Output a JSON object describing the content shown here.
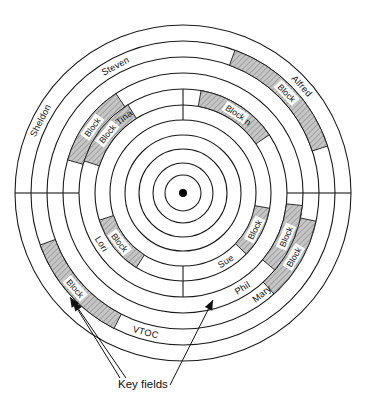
{
  "figure": {
    "type": "disk-track-diagram",
    "center": {
      "x": 183,
      "y": 193
    },
    "hub_dot_radius": 4,
    "ring_radii": [
      18,
      30,
      44,
      58,
      73,
      88,
      104,
      120,
      136,
      152,
      168
    ],
    "colors": {
      "line": "#1a1a1a",
      "block_fill": "#b9b9b9",
      "background": "#ffffff",
      "label_text": "#111111"
    }
  },
  "tracks": [
    {
      "id": "track-outer",
      "index": 1,
      "inner_radius": 152,
      "outer_radius": 168,
      "labels": [
        {
          "name": "Alfred",
          "angle": -42
        },
        {
          "name": "Sheldon",
          "angle": 207
        }
      ],
      "blocks": [],
      "sector_breaks": [
        0,
        180
      ]
    },
    {
      "id": "track-2",
      "index": 2,
      "inner_radius": 136,
      "outer_radius": 152,
      "labels": [
        {
          "name": "Steven",
          "angle": 242
        },
        {
          "name": "VTOC",
          "angle": 105
        }
      ],
      "blocks": [
        {
          "label": "Block",
          "start_angle": -70,
          "end_angle": -18
        },
        {
          "label": "Block",
          "start_angle": 117,
          "end_angle": 160
        }
      ],
      "sector_breaks": [
        0,
        180
      ]
    },
    {
      "id": "track-3",
      "index": 3,
      "inner_radius": 120,
      "outer_radius": 136,
      "labels": [
        {
          "name": "Mary",
          "angle": 52
        }
      ],
      "blocks": [
        {
          "label": "Block",
          "start_angle": 12,
          "end_angle": 48
        }
      ],
      "sector_breaks": [
        0,
        180
      ]
    },
    {
      "id": "track-4",
      "index": 4,
      "inner_radius": 104,
      "outer_radius": 120,
      "labels": [
        {
          "name": "Phil",
          "angle": 58
        }
      ],
      "blocks": [
        {
          "label": "Block",
          "start_angle": 6,
          "end_angle": 40
        },
        {
          "label": "Block",
          "start_angle": 196,
          "end_angle": 236
        }
      ],
      "sector_breaks": [
        0,
        180
      ]
    },
    {
      "id": "track-5",
      "index": 5,
      "inner_radius": 88,
      "outer_radius": 104,
      "labels": [
        {
          "name": "Tina",
          "angle": 232
        },
        {
          "name": "John",
          "angle": -52
        },
        {
          "name": "Lori",
          "angle": 148
        }
      ],
      "blocks": [
        {
          "label": "Block",
          "start_angle": -80,
          "end_angle": -34
        },
        {
          "label": "Block",
          "start_angle": 198,
          "end_angle": 238
        }
      ],
      "sector_breaks": [
        270,
        90
      ]
    },
    {
      "id": "track-6",
      "index": 6,
      "inner_radius": 73,
      "outer_radius": 88,
      "labels": [
        {
          "name": "Sue",
          "angle": 58
        }
      ],
      "blocks": [
        {
          "label": "Block",
          "start_angle": 10,
          "end_angle": 44
        },
        {
          "label": "Block",
          "start_angle": 122,
          "end_angle": 162
        }
      ],
      "sector_breaks": [
        90,
        270
      ]
    },
    {
      "id": "track-7",
      "index": 7,
      "inner_radius": 58,
      "outer_radius": 73,
      "labels": [],
      "blocks": [],
      "sector_breaks": []
    },
    {
      "id": "track-8",
      "index": 8,
      "inner_radius": 44,
      "outer_radius": 58,
      "labels": [],
      "blocks": [],
      "sector_breaks": []
    },
    {
      "id": "track-9",
      "index": 9,
      "inner_radius": 30,
      "outer_radius": 44,
      "labels": [],
      "blocks": [],
      "sector_breaks": []
    },
    {
      "id": "track-10",
      "index": 10,
      "inner_radius": 18,
      "outer_radius": 30,
      "labels": [],
      "blocks": [],
      "sector_breaks": []
    }
  ],
  "annotations": {
    "callout_label": "Key fields",
    "callout_text_x": 118,
    "callout_text_y": 388,
    "arrows": [
      {
        "id": "arrow-left",
        "from": {
          "x": 120,
          "y": 378
        },
        "to": {
          "x": 70,
          "y": 297
        },
        "target": "block-track-2-lower-left"
      },
      {
        "id": "arrow-left-2",
        "from": {
          "x": 126,
          "y": 378
        },
        "to": {
          "x": 73,
          "y": 301
        },
        "target": "block-track-2-lower-left-edge"
      },
      {
        "id": "arrow-right",
        "from": {
          "x": 170,
          "y": 385
        },
        "to": {
          "x": 213,
          "y": 300
        },
        "target": "sector-boundary-bottom"
      }
    ]
  },
  "legend": {
    "block_label": "Block",
    "vtoc_label": "VTOC"
  }
}
